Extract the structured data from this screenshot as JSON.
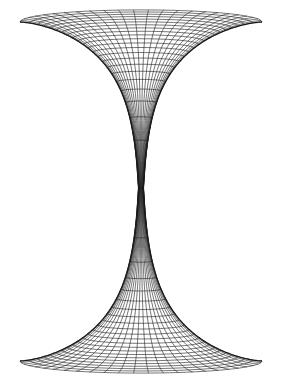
{
  "figure": {
    "background": "#ffffff",
    "stroke": "#1a1a1a",
    "center_x": 141,
    "waist_y": 188,
    "top_rim_y": 22,
    "bottom_rim_y": 361,
    "half_width": 121,
    "meridians": 25,
    "parallels": 22,
    "view_tilt": 0.1
  }
}
